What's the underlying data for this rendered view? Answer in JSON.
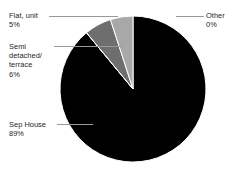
{
  "chart_data": {
    "type": "pie",
    "title": "",
    "xlabel": "",
    "ylabel": "",
    "legend_position": "none",
    "grid": false,
    "labels_show_percent": true,
    "start_angle_deg": 0,
    "direction": "clockwise",
    "categories": [
      "Sep House",
      "Other",
      "Flat, unit",
      "Semi detached/\nterrace"
    ],
    "values": [
      89,
      0,
      5,
      6
    ],
    "value_labels": [
      "89%",
      "0%",
      "5%",
      "6%"
    ],
    "colors": [
      "#000000",
      "#c9c9c9",
      "#a8a8a8",
      "#6e6e6e"
    ],
    "slices": [
      {
        "name": "Sep House",
        "label": "Sep House",
        "percent": 89,
        "percent_label": "89%",
        "color": "#000000",
        "start_deg": 0,
        "end_deg": 320.4
      },
      {
        "name": "Other",
        "label": "Other",
        "percent": 0,
        "percent_label": "0%",
        "color": "#c9c9c9",
        "start_deg": 320.4,
        "end_deg": 320.4
      },
      {
        "name": "Semi detached/terrace",
        "label": "Semi detached/\nterrace",
        "percent": 6,
        "percent_label": "6%",
        "color": "#6e6e6e",
        "start_deg": 320.4,
        "end_deg": 342.0
      },
      {
        "name": "Flat, unit",
        "label": "Flat, unit",
        "percent": 5,
        "percent_label": "5%",
        "color": "#a8a8a8",
        "start_deg": 342.0,
        "end_deg": 360.0
      }
    ]
  },
  "geometry": {
    "center_x": 133,
    "center_y": 89,
    "radius": 73,
    "separator_color": "#ffffff",
    "background": "#ffffff"
  },
  "callouts": {
    "flat_unit": {
      "name": "Flat, unit",
      "value": "5%",
      "text": "Flat, unit\n5%"
    },
    "semi_detached": {
      "name": "Semi detached/\nterrace",
      "value": "6%",
      "text": "Semi\ndetached/\nterrace\n6%"
    },
    "sep_house": {
      "name": "Sep House",
      "value": "89%",
      "text": "Sep House\n89%"
    },
    "other": {
      "name": "Other",
      "value": "0%",
      "text": "Other\n0%"
    }
  },
  "style": {
    "leader_line_color": "#9a9a9a",
    "text_color": "#1c1c1c"
  }
}
